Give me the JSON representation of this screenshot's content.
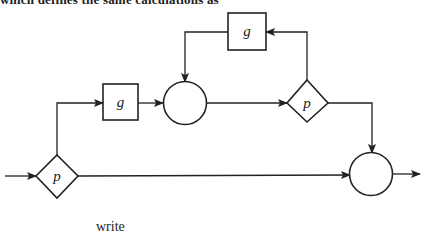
{
  "header": {
    "text": "which defines the same calculations as"
  },
  "diagram": {
    "nodes": [
      {
        "id": "p1",
        "type": "decision",
        "label": "p"
      },
      {
        "id": "g1",
        "type": "process",
        "label": "g"
      },
      {
        "id": "c1",
        "type": "junction",
        "label": ""
      },
      {
        "id": "p2",
        "type": "decision",
        "label": "p"
      },
      {
        "id": "g2",
        "type": "process",
        "label": "g"
      },
      {
        "id": "c2",
        "type": "junction",
        "label": ""
      }
    ],
    "edges": [
      {
        "from": "input",
        "to": "p1"
      },
      {
        "from": "p1",
        "to": "g1"
      },
      {
        "from": "p1",
        "to": "c2"
      },
      {
        "from": "g1",
        "to": "c1"
      },
      {
        "from": "c1",
        "to": "p2"
      },
      {
        "from": "p2",
        "to": "g2"
      },
      {
        "from": "g2",
        "to": "c1"
      },
      {
        "from": "p2",
        "to": "c2"
      },
      {
        "from": "c2",
        "to": "output"
      }
    ]
  },
  "footer": {
    "text": "write"
  }
}
